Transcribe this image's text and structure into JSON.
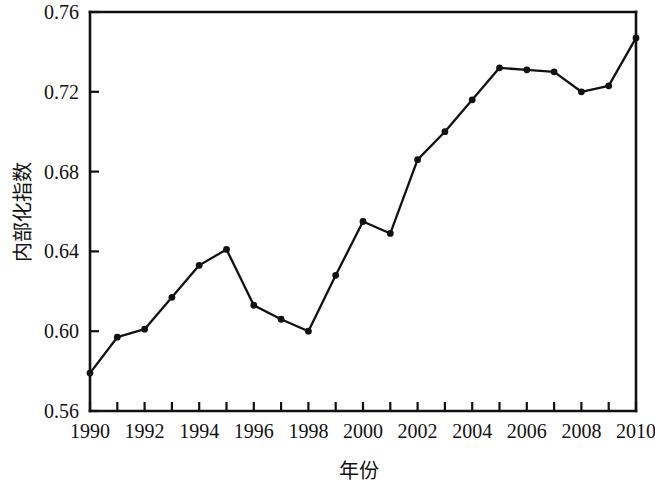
{
  "chart_data": {
    "type": "line",
    "title": "",
    "subtitle": "",
    "xlabel": "年份",
    "ylabel": "内部化指数",
    "x": [
      1990,
      1991,
      1992,
      1993,
      1994,
      1995,
      1996,
      1997,
      1998,
      1999,
      2000,
      2001,
      2002,
      2003,
      2004,
      2005,
      2006,
      2007,
      2008,
      2009,
      2010
    ],
    "values": [
      0.579,
      0.597,
      0.601,
      0.617,
      0.633,
      0.641,
      0.613,
      0.606,
      0.6,
      0.628,
      0.655,
      0.649,
      0.686,
      0.7,
      0.716,
      0.732,
      0.731,
      0.73,
      0.72,
      0.723,
      0.747
    ],
    "series": [
      {
        "name": "内部化指数",
        "values": [
          0.579,
          0.597,
          0.601,
          0.617,
          0.633,
          0.641,
          0.613,
          0.606,
          0.6,
          0.628,
          0.655,
          0.649,
          0.686,
          0.7,
          0.716,
          0.732,
          0.731,
          0.73,
          0.72,
          0.723,
          0.747
        ]
      }
    ],
    "xlim": [
      1990,
      2010
    ],
    "ylim": [
      0.56,
      0.76
    ],
    "xticks": [
      1990,
      1991,
      1992,
      1993,
      1994,
      1995,
      1996,
      1997,
      1998,
      1999,
      2000,
      2001,
      2002,
      2003,
      2004,
      2005,
      2006,
      2007,
      2008,
      2009,
      2010
    ],
    "xtick_labels": [
      "1990",
      "",
      "1992",
      "",
      "1994",
      "",
      "1996",
      "",
      "1998",
      "",
      "2000",
      "",
      "2002",
      "",
      "2004",
      "",
      "2006",
      "",
      "2008",
      "",
      "2010"
    ],
    "yticks": [
      0.56,
      0.6,
      0.64,
      0.68,
      0.72,
      0.76
    ],
    "ytick_labels": [
      "0.56",
      "0.60",
      "0.64",
      "0.68",
      "0.72",
      "0.76"
    ],
    "grid": false,
    "legend": false,
    "legend_position": "none",
    "marker": "circle",
    "line_color": "#111111",
    "marker_color": "#111111",
    "background_color": "#ffffff"
  }
}
